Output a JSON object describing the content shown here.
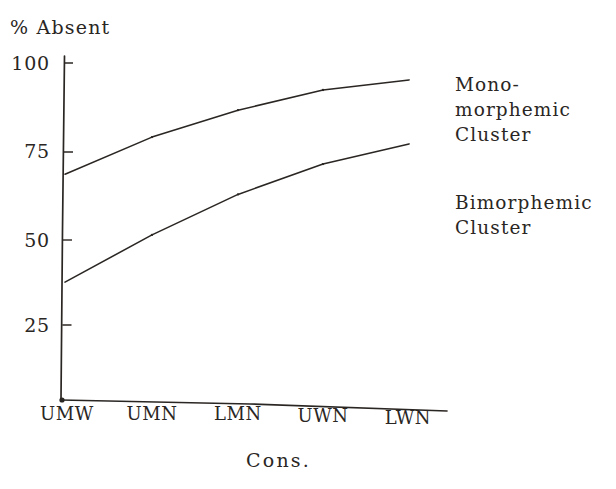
{
  "chart_data": {
    "type": "line",
    "title": "",
    "ylabel": "% Absent",
    "xlabel": "Cons.",
    "categories": [
      "UMW",
      "UMN",
      "LMN",
      "UWN",
      "LWN"
    ],
    "yticks": [
      "25",
      "50",
      "75",
      "100"
    ],
    "ytick_values": [
      25,
      50,
      75,
      100
    ],
    "ylim": [
      0,
      100
    ],
    "grid": false,
    "legend_position": "right",
    "series": [
      {
        "name": "Mono-morphemic Cluster",
        "values": [
          67,
          78,
          86,
          92,
          95
        ]
      },
      {
        "name": "Bimorphemic Cluster",
        "values": [
          35,
          49,
          61,
          70,
          76
        ]
      }
    ]
  },
  "axis": {
    "y_title": "% Absent",
    "x_title": "Cons.",
    "y_labels": [
      "100",
      "75",
      "50",
      "25"
    ],
    "x_labels": [
      "UMW",
      "UMN",
      "LMN",
      "UWN",
      "LWN"
    ]
  },
  "legend": {
    "mono": {
      "line1": "Mono-",
      "line2": "morphemic",
      "line3": "Cluster"
    },
    "bi": {
      "line1": "Bimorphemic",
      "line2": "Cluster"
    }
  },
  "colors": {
    "ink": "#2a2623",
    "background": "#ffffff"
  }
}
